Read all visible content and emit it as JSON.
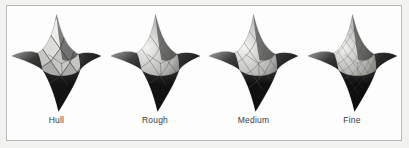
{
  "figure": {
    "kind": "tessellation-comparison",
    "background_color": "#f2f2f0",
    "frame_background_color": "#fdfdfd",
    "frame_border_color": "#b9b9b5",
    "label_color": "#3a3a3a",
    "shape_description": "four-pointed star surface",
    "panels": [
      {
        "id": "hull",
        "label": "Hull",
        "mesh_style": "faceted",
        "wire_color": "#4a4a4a",
        "highlight_color": "#f0f0ee",
        "midtone_color": "#a8a8a6",
        "shadow_color": "#2b2b2b",
        "dark_color": "#121212"
      },
      {
        "id": "rough",
        "label": "Rough",
        "mesh_style": "smooth-coarse",
        "wire_color": "#55554f",
        "highlight_color": "#f4f4f2",
        "midtone_color": "#b0b0ad",
        "shadow_color": "#2e2e2e",
        "dark_color": "#111111"
      },
      {
        "id": "medium",
        "label": "Medium",
        "mesh_style": "smooth-medium",
        "wire_color": "#5a5a54",
        "highlight_color": "#f5f5f3",
        "midtone_color": "#b4b4b1",
        "shadow_color": "#303030",
        "dark_color": "#101010"
      },
      {
        "id": "fine",
        "label": "Fine",
        "mesh_style": "smooth-fine",
        "wire_color": "#4f4f4a",
        "highlight_color": "#f1f1ef",
        "midtone_color": "#a9a9a6",
        "shadow_color": "#2a2a2a",
        "dark_color": "#0e0e0e"
      }
    ]
  }
}
